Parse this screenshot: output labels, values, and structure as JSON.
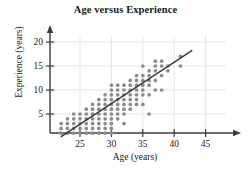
{
  "chart_data": {
    "type": "scatter",
    "title": "Age versus Experience",
    "xlabel": "Age (years)",
    "ylabel": "Experience (years)",
    "xlim": [
      21,
      46.5
    ],
    "ylim": [
      0,
      21.5
    ],
    "xticks": [
      25,
      30,
      35,
      40,
      45
    ],
    "yticks": [
      5,
      10,
      15,
      20
    ],
    "grid": true,
    "legend": null,
    "dot_color": "#8c8c8c",
    "line_color": "#3c3c3c",
    "axis_color": "#3c3c3c",
    "grid_color": "#e2e2e2",
    "trend_line": {
      "type": "linear",
      "x_start": 22.0,
      "y_start": 0.3,
      "x_end": 42.8,
      "y_end": 18.2
    },
    "points": [
      [
        22,
        1
      ],
      [
        22,
        2
      ],
      [
        22,
        3
      ],
      [
        23,
        1
      ],
      [
        23,
        2
      ],
      [
        23,
        3
      ],
      [
        23,
        4
      ],
      [
        24,
        1
      ],
      [
        24,
        2
      ],
      [
        24,
        3
      ],
      [
        24,
        4
      ],
      [
        24,
        5
      ],
      [
        25,
        1
      ],
      [
        25,
        2
      ],
      [
        25,
        3
      ],
      [
        25,
        4
      ],
      [
        25,
        5
      ],
      [
        26,
        1
      ],
      [
        26,
        2
      ],
      [
        26,
        3
      ],
      [
        26,
        4
      ],
      [
        26,
        5
      ],
      [
        26,
        6
      ],
      [
        27,
        1
      ],
      [
        27,
        2
      ],
      [
        27,
        3
      ],
      [
        27,
        4
      ],
      [
        27,
        5
      ],
      [
        27,
        6
      ],
      [
        27,
        7
      ],
      [
        28,
        1
      ],
      [
        28,
        2
      ],
      [
        28,
        3
      ],
      [
        28,
        4
      ],
      [
        28,
        5
      ],
      [
        28,
        6
      ],
      [
        28,
        7
      ],
      [
        28,
        8
      ],
      [
        29,
        1
      ],
      [
        29,
        2
      ],
      [
        29,
        3
      ],
      [
        29,
        4
      ],
      [
        29,
        5
      ],
      [
        29,
        6
      ],
      [
        29,
        7
      ],
      [
        29,
        8
      ],
      [
        29,
        9
      ],
      [
        30,
        1
      ],
      [
        30,
        2
      ],
      [
        30,
        3
      ],
      [
        30,
        4
      ],
      [
        30,
        5
      ],
      [
        30,
        6
      ],
      [
        30,
        7
      ],
      [
        30,
        8
      ],
      [
        30,
        9
      ],
      [
        30,
        10
      ],
      [
        30,
        11
      ],
      [
        31,
        4
      ],
      [
        31,
        5
      ],
      [
        31,
        6
      ],
      [
        31,
        7
      ],
      [
        31,
        8
      ],
      [
        31,
        9
      ],
      [
        31,
        10
      ],
      [
        31,
        11
      ],
      [
        32,
        3
      ],
      [
        32,
        5
      ],
      [
        32,
        6
      ],
      [
        32,
        7
      ],
      [
        32,
        8
      ],
      [
        32,
        9
      ],
      [
        32,
        10
      ],
      [
        32,
        11
      ],
      [
        33,
        6
      ],
      [
        33,
        7
      ],
      [
        33,
        8
      ],
      [
        33,
        9
      ],
      [
        33,
        10
      ],
      [
        33,
        11
      ],
      [
        33,
        12
      ],
      [
        34,
        7
      ],
      [
        34,
        8
      ],
      [
        34,
        9
      ],
      [
        34,
        10
      ],
      [
        34,
        11
      ],
      [
        34,
        12
      ],
      [
        34,
        13
      ],
      [
        35,
        7
      ],
      [
        35,
        9
      ],
      [
        35,
        10
      ],
      [
        35,
        11
      ],
      [
        35,
        12
      ],
      [
        35,
        13
      ],
      [
        35,
        15
      ],
      [
        36,
        5
      ],
      [
        36,
        9
      ],
      [
        36,
        11
      ],
      [
        36,
        12
      ],
      [
        36,
        13
      ],
      [
        36,
        14
      ],
      [
        37,
        10
      ],
      [
        37,
        12
      ],
      [
        37,
        14
      ],
      [
        37,
        15
      ],
      [
        37,
        16
      ],
      [
        38,
        10
      ],
      [
        38,
        13
      ],
      [
        38,
        15
      ],
      [
        38,
        16
      ],
      [
        39,
        14
      ],
      [
        39,
        15
      ],
      [
        41,
        15
      ],
      [
        41,
        17
      ]
    ]
  }
}
